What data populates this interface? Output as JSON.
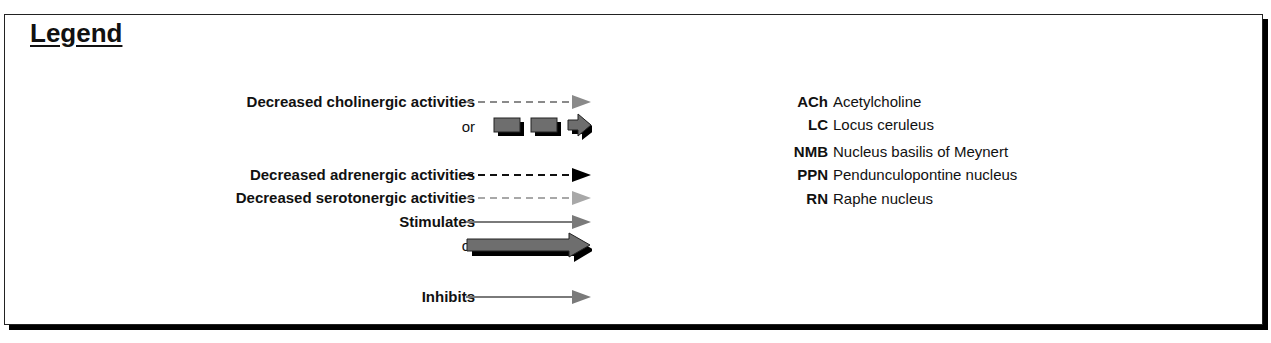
{
  "legend": {
    "title": "Legend",
    "arrow_entries": [
      {
        "label": "Decreased cholinergic activities",
        "style": "dashed",
        "color": "#8a8a8a",
        "head_color": "#8a8a8a"
      },
      {
        "label": "or",
        "style": "block-segmented",
        "color": "#6e6e6e",
        "shadow": "#000000"
      },
      {
        "label": "Decreased adrenergic activities",
        "style": "dashed",
        "color": "#111111",
        "head_color": "#000000"
      },
      {
        "label": "Decreased serotonergic activities",
        "style": "dashed",
        "color": "#a8a8a8",
        "head_color": "#a8a8a8"
      },
      {
        "label": "Stimulates",
        "style": "solid",
        "color": "#7a7a7a",
        "head_color": "#7a7a7a"
      },
      {
        "label": "or",
        "style": "block-solid",
        "color": "#6e6e6e",
        "shadow": "#000000"
      },
      {
        "label": "Inhibits",
        "style": "solid",
        "color": "#7a7a7a",
        "head_color": "#7a7a7a"
      }
    ],
    "abbreviations": [
      {
        "abbr": "ACh",
        "meaning": "Acetylcholine"
      },
      {
        "abbr": "LC",
        "meaning": "Locus ceruleus"
      },
      {
        "abbr": "NMB",
        "meaning": "Nucleus basilis of Meynert"
      },
      {
        "abbr": "PPN",
        "meaning": "Pendunculopontine nucleus"
      },
      {
        "abbr": "RN",
        "meaning": "Raphe nucleus"
      }
    ]
  }
}
